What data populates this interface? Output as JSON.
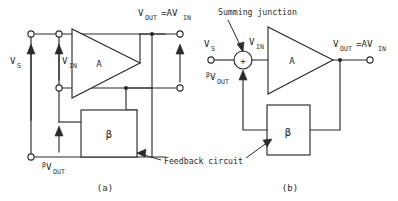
{
  "figure": {
    "background_color": "#ffffff",
    "line_color": "#2b2b2b"
  },
  "panel_a": {
    "caption": "(a)",
    "source_label": "V",
    "source_sub": "S",
    "input_label": "V",
    "input_sub": "IN",
    "output_label": "V",
    "output_sub": "OUT",
    "output_eq": "=AV",
    "output_eq_sub": "IN",
    "feedback_voltage_beta": "β",
    "feedback_voltage_label": "V",
    "feedback_voltage_sub": "OUT",
    "amplifier_label": "A",
    "beta_block_label": "β",
    "annotation": "Feedback circuit"
  },
  "panel_b": {
    "caption": "(b)",
    "source_label": "V",
    "source_sub": "S",
    "input_label": "V",
    "input_sub": "IN",
    "output_label": "V",
    "output_sub": "OUT",
    "output_eq": "=AV",
    "output_eq_sub": "IN",
    "feedback_voltage_beta": "β",
    "feedback_voltage_label": "V",
    "feedback_voltage_sub": "OUT",
    "amplifier_label": "A",
    "beta_block_label": "β",
    "summing_junction_sign": "+",
    "summing_junction_annotation": "Summing junction"
  }
}
